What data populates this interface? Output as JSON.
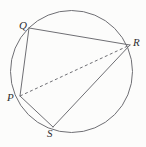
{
  "figure": {
    "kind": "geometry-diagram",
    "canvas": {
      "width": 146,
      "height": 147
    },
    "background_color": "#fcfcfb",
    "stroke_color": "#6f6f74",
    "label_color": "#2e2e30",
    "circle": {
      "name": "circumscribed-circle",
      "cx": 71.5,
      "cy": 71.5,
      "r": 61,
      "stroke_width": 1
    },
    "points": [
      {
        "id": "Q",
        "label": "Q",
        "x": 29,
        "y": 28,
        "label_x": 19,
        "label_y": 20
      },
      {
        "id": "R",
        "label": "R",
        "x": 130,
        "y": 45,
        "label_x": 133,
        "label_y": 37
      },
      {
        "id": "P",
        "label": "P",
        "x": 20,
        "y": 96,
        "label_x": 7,
        "label_y": 92
      },
      {
        "id": "S",
        "label": "S",
        "x": 53,
        "y": 127,
        "label_x": 47,
        "label_y": 128
      }
    ],
    "segments": [
      {
        "id": "QR",
        "from": "Q",
        "to": "R",
        "style": "solid",
        "x1": 29,
        "y1": 28,
        "x2": 130,
        "y2": 45
      },
      {
        "id": "QP",
        "from": "Q",
        "to": "P",
        "style": "solid",
        "x1": 29,
        "y1": 28,
        "x2": 20,
        "y2": 96
      },
      {
        "id": "PS",
        "from": "P",
        "to": "S",
        "style": "solid",
        "x1": 20,
        "y1": 96,
        "x2": 53,
        "y2": 127
      },
      {
        "id": "SR",
        "from": "S",
        "to": "R",
        "style": "solid",
        "x1": 53,
        "y1": 127,
        "x2": 130,
        "y2": 45
      },
      {
        "id": "PR",
        "from": "P",
        "to": "R",
        "style": "dashed",
        "x1": 20,
        "y1": 96,
        "x2": 130,
        "y2": 45,
        "dash": "3 2.5"
      }
    ]
  }
}
